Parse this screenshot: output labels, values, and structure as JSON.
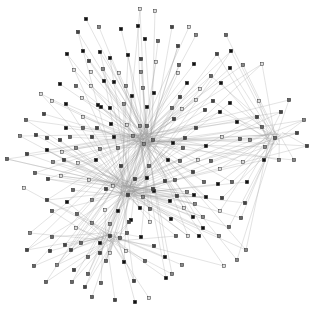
{
  "diagram": {
    "type": "network-graph",
    "background": "#ffffff",
    "edge_color": "#9a9a9a",
    "node_shape": "square",
    "node_colors": [
      "#111111",
      "#444444",
      "#666666",
      "#888888",
      "#dddddd"
    ],
    "hubs": [
      {
        "x": 145,
        "y": 140
      },
      {
        "x": 128,
        "y": 190
      },
      {
        "x": 275,
        "y": 139
      },
      {
        "x": 110,
        "y": 238
      }
    ],
    "nodes": [
      [
        86,
        19
      ],
      [
        78,
        32
      ],
      [
        99,
        27
      ],
      [
        121,
        29
      ],
      [
        138,
        26
      ],
      [
        140,
        9
      ],
      [
        155,
        11
      ],
      [
        145,
        39
      ],
      [
        158,
        41
      ],
      [
        67,
        54
      ],
      [
        83,
        51
      ],
      [
        89,
        61
      ],
      [
        100,
        52
      ],
      [
        110,
        58
      ],
      [
        128,
        55
      ],
      [
        141,
        59
      ],
      [
        156,
        62
      ],
      [
        74,
        70
      ],
      [
        91,
        72
      ],
      [
        103,
        69
      ],
      [
        119,
        73
      ],
      [
        141,
        72
      ],
      [
        60,
        84
      ],
      [
        76,
        86
      ],
      [
        91,
        86
      ],
      [
        104,
        81
      ],
      [
        114,
        82
      ],
      [
        126,
        86
      ],
      [
        143,
        88
      ],
      [
        154,
        93
      ],
      [
        41,
        94
      ],
      [
        52,
        101
      ],
      [
        66,
        104
      ],
      [
        82,
        98
      ],
      [
        98,
        105
      ],
      [
        110,
        108
      ],
      [
        124,
        104
      ],
      [
        132,
        96
      ],
      [
        147,
        107
      ],
      [
        44,
        114
      ],
      [
        83,
        117
      ],
      [
        101,
        107
      ],
      [
        26,
        120
      ],
      [
        66,
        128
      ],
      [
        83,
        128
      ],
      [
        97,
        128
      ],
      [
        111,
        124
      ],
      [
        127,
        125
      ],
      [
        140,
        126
      ],
      [
        147,
        126
      ],
      [
        20,
        136
      ],
      [
        36,
        135
      ],
      [
        47,
        138
      ],
      [
        60,
        140
      ],
      [
        70,
        137
      ],
      [
        92,
        137
      ],
      [
        114,
        137
      ],
      [
        133,
        136
      ],
      [
        144,
        144
      ],
      [
        153,
        140
      ],
      [
        27,
        154
      ],
      [
        47,
        150
      ],
      [
        62,
        152
      ],
      [
        76,
        148
      ],
      [
        100,
        149
      ],
      [
        118,
        148
      ],
      [
        172,
        27
      ],
      [
        189,
        27
      ],
      [
        178,
        46
      ],
      [
        196,
        35
      ],
      [
        226,
        35
      ],
      [
        217,
        54
      ],
      [
        231,
        51
      ],
      [
        179,
        65
      ],
      [
        194,
        64
      ],
      [
        230,
        68
      ],
      [
        211,
        76
      ],
      [
        243,
        65
      ],
      [
        262,
        64
      ],
      [
        178,
        73
      ],
      [
        187,
        83
      ],
      [
        221,
        83
      ],
      [
        200,
        89
      ],
      [
        180,
        97
      ],
      [
        196,
        100
      ],
      [
        213,
        101
      ],
      [
        259,
        101
      ],
      [
        230,
        103
      ],
      [
        289,
        100
      ],
      [
        281,
        112
      ],
      [
        304,
        120
      ],
      [
        172,
        108
      ],
      [
        182,
        109
      ],
      [
        205,
        110
      ],
      [
        220,
        112
      ],
      [
        237,
        122
      ],
      [
        257,
        117
      ],
      [
        262,
        127
      ],
      [
        174,
        119
      ],
      [
        196,
        128
      ],
      [
        185,
        138
      ],
      [
        222,
        137
      ],
      [
        240,
        139
      ],
      [
        250,
        140
      ],
      [
        275,
        138
      ],
      [
        297,
        133
      ],
      [
        307,
        146
      ],
      [
        206,
        146
      ],
      [
        173,
        143
      ],
      [
        183,
        148
      ],
      [
        265,
        147
      ],
      [
        7,
        159
      ],
      [
        53,
        162
      ],
      [
        64,
        160
      ],
      [
        78,
        163
      ],
      [
        96,
        160
      ],
      [
        121,
        166
      ],
      [
        149,
        166
      ],
      [
        35,
        173
      ],
      [
        48,
        179
      ],
      [
        61,
        176
      ],
      [
        89,
        180
      ],
      [
        113,
        186
      ],
      [
        135,
        179
      ],
      [
        147,
        178
      ],
      [
        24,
        188
      ],
      [
        73,
        190
      ],
      [
        106,
        189
      ],
      [
        128,
        195
      ],
      [
        143,
        197
      ],
      [
        154,
        191
      ],
      [
        47,
        200
      ],
      [
        67,
        202
      ],
      [
        92,
        200
      ],
      [
        153,
        189
      ],
      [
        52,
        211
      ],
      [
        77,
        214
      ],
      [
        105,
        210
      ],
      [
        118,
        211
      ],
      [
        131,
        220
      ],
      [
        140,
        208
      ],
      [
        150,
        209
      ],
      [
        76,
        228
      ],
      [
        92,
        223
      ],
      [
        110,
        224
      ],
      [
        129,
        222
      ],
      [
        150,
        222
      ],
      [
        30,
        233
      ],
      [
        52,
        237
      ],
      [
        65,
        245
      ],
      [
        81,
        243
      ],
      [
        100,
        243
      ],
      [
        110,
        236
      ],
      [
        120,
        238
      ],
      [
        127,
        233
      ],
      [
        141,
        237
      ],
      [
        154,
        246
      ],
      [
        27,
        250
      ],
      [
        50,
        251
      ],
      [
        71,
        250
      ],
      [
        88,
        257
      ],
      [
        100,
        253
      ],
      [
        110,
        253
      ],
      [
        126,
        251
      ],
      [
        145,
        261
      ],
      [
        34,
        266
      ],
      [
        57,
        265
      ],
      [
        74,
        270
      ],
      [
        88,
        274
      ],
      [
        106,
        261
      ],
      [
        124,
        262
      ],
      [
        46,
        282
      ],
      [
        72,
        282
      ],
      [
        85,
        287
      ],
      [
        101,
        283
      ],
      [
        134,
        281
      ],
      [
        92,
        297
      ],
      [
        115,
        300
      ],
      [
        135,
        302
      ],
      [
        149,
        298
      ],
      [
        168,
        160
      ],
      [
        180,
        161
      ],
      [
        198,
        160
      ],
      [
        211,
        161
      ],
      [
        243,
        162
      ],
      [
        264,
        160
      ],
      [
        279,
        160
      ],
      [
        294,
        160
      ],
      [
        220,
        169
      ],
      [
        193,
        172
      ],
      [
        165,
        181
      ],
      [
        175,
        180
      ],
      [
        204,
        182
      ],
      [
        218,
        184
      ],
      [
        232,
        182
      ],
      [
        247,
        182
      ],
      [
        187,
        192
      ],
      [
        177,
        196
      ],
      [
        194,
        195
      ],
      [
        206,
        197
      ],
      [
        222,
        198
      ],
      [
        245,
        203
      ],
      [
        170,
        201
      ],
      [
        184,
        208
      ],
      [
        195,
        204
      ],
      [
        220,
        211
      ],
      [
        241,
        218
      ],
      [
        171,
        219
      ],
      [
        193,
        217
      ],
      [
        203,
        217
      ],
      [
        229,
        227
      ],
      [
        203,
        228
      ],
      [
        176,
        236
      ],
      [
        188,
        236
      ],
      [
        199,
        236
      ],
      [
        219,
        236
      ],
      [
        165,
        257
      ],
      [
        246,
        250
      ],
      [
        237,
        260
      ],
      [
        224,
        266
      ],
      [
        166,
        278
      ],
      [
        182,
        265
      ],
      [
        172,
        274
      ]
    ]
  }
}
